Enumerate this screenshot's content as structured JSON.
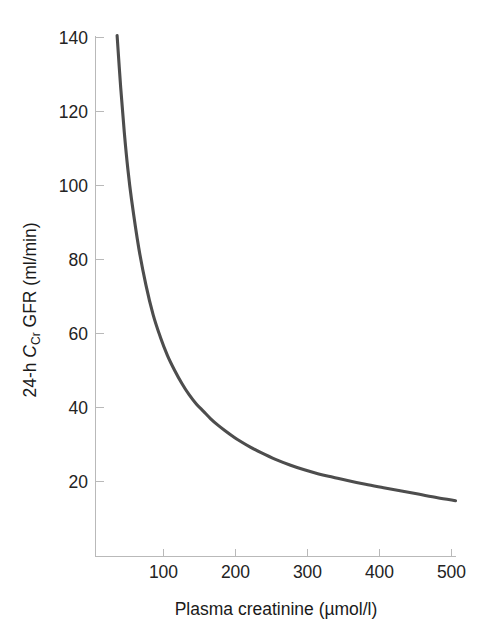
{
  "chart_data": {
    "type": "line",
    "title": "",
    "subtitle": "",
    "xlabel": "Plasma creatinine (µmol/l)",
    "ylabel": "24-h C_Cr GFR (ml/min)",
    "ylabel_parts": {
      "prefix": "24-h ",
      "italic_symbol": "C",
      "subscript": "Cr",
      "suffix": " GFR (ml/min)"
    },
    "xlim": [
      0,
      500
    ],
    "ylim": [
      0,
      140
    ],
    "xticks": [
      100,
      200,
      300,
      400,
      500
    ],
    "xtick_labels": [
      "100",
      "200",
      "300",
      "400",
      "500"
    ],
    "yticks": [
      20,
      40,
      60,
      80,
      100,
      120,
      140
    ],
    "ytick_labels": [
      "20",
      "40",
      "60",
      "80",
      "100",
      "120",
      "140"
    ],
    "grid": false,
    "legend": null,
    "annotations": [],
    "series": [
      {
        "name": "24-h creatinine clearance GFR",
        "color": "#4d4d4d",
        "x": [
          30,
          35,
          40,
          45,
          50,
          60,
          70,
          80,
          90,
          100,
          110,
          120,
          130,
          140,
          150,
          160,
          170,
          180,
          190,
          200,
          215,
          230,
          250,
          270,
          290,
          310,
          330,
          350,
          375,
          400,
          425,
          450,
          475,
          500
        ],
        "y": [
          140,
          126,
          114,
          104,
          96,
          83,
          73,
          65,
          59,
          54,
          50,
          46.5,
          43.5,
          41,
          39,
          37,
          35.3,
          33.8,
          32.4,
          31.1,
          29.4,
          27.9,
          26.1,
          24.6,
          23.3,
          22.2,
          21.3,
          20.4,
          19.4,
          18.5,
          17.6,
          16.7,
          15.8,
          15
        ]
      }
    ],
    "axis_color": "#b9b9b9",
    "label_color": "#232323"
  },
  "figure": {
    "background": "#ffffff",
    "caption": ""
  }
}
